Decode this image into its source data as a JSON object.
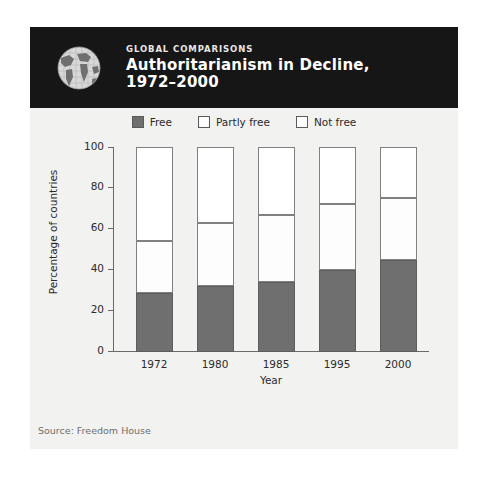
{
  "header": {
    "kicker": "GLOBAL COMPARISONS",
    "title_line1": "Authoritarianism in Decline,",
    "title_line2": "1972–2000",
    "icon": "globe-icon",
    "background_color": "#161616",
    "text_color": "#ffffff"
  },
  "footer": {
    "source": "Source: Freedom House"
  },
  "colors": {
    "free": "#706f6f",
    "partly_free": "#fdfdfd",
    "not_free": "#ffffff",
    "panel_background": "#f2f2f0",
    "axis": "#6a6a6a"
  },
  "chart_data": {
    "type": "bar",
    "stacked": true,
    "title": "Authoritarianism in Decline, 1972–2000",
    "xlabel": "Year",
    "ylabel": "Percentage of countries",
    "categories": [
      "1972",
      "1980",
      "1985",
      "1995",
      "2000"
    ],
    "ylim": [
      0,
      100
    ],
    "yticks": [
      0,
      20,
      40,
      60,
      80,
      100
    ],
    "ytick_labels": [
      "0",
      "20",
      "40",
      "60",
      "80",
      "100"
    ],
    "grid": false,
    "legend_position": "top-center",
    "series": [
      {
        "name": "Free",
        "values": [
          29,
          32,
          34,
          40,
          45
        ]
      },
      {
        "name": "Partly free",
        "values": [
          25,
          31,
          33,
          32,
          30
        ]
      },
      {
        "name": "Not free",
        "values": [
          46,
          37,
          33,
          28,
          25
        ]
      }
    ],
    "cumulative_tops": {
      "free": [
        29,
        32,
        34,
        40,
        45
      ],
      "partly_free": [
        54,
        63,
        67,
        72,
        75
      ],
      "not_free": [
        100,
        100,
        100,
        100,
        100
      ]
    },
    "annotations": [
      "Source: Freedom House"
    ]
  },
  "legend": [
    {
      "label": "Free",
      "swatch": "#706f6f"
    },
    {
      "label": "Partly free",
      "swatch": "#fdfdfd"
    },
    {
      "label": "Not free",
      "swatch": "#ffffff"
    }
  ]
}
